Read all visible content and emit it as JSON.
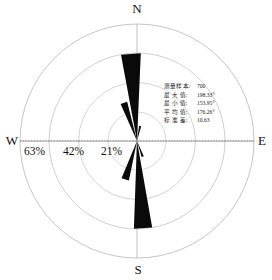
{
  "compass": {
    "north": "N",
    "south": "S",
    "west": "W",
    "east": "E"
  },
  "ring_labels": [
    "63%",
    "42%",
    "21%"
  ],
  "stats": [
    {
      "key": "测量样本:",
      "value": "700"
    },
    {
      "key": "最 大 值:",
      "value": "198.33°"
    },
    {
      "key": "最 小 值:",
      "value": "153.95°"
    },
    {
      "key": "平 均 值:",
      "value": "176.26°"
    },
    {
      "key": "标 准 差:",
      "value": "10.63"
    }
  ],
  "colors": {
    "petal_fill": "#0a0a0a",
    "grid_line": "#b9b9b9",
    "axis_line": "#9a9a9a",
    "text": "#111111"
  },
  "chart_data": {
    "type": "bar",
    "subtype": "wind-rose",
    "title": "",
    "xlabel": "",
    "ylabel": "",
    "orientation": "compass",
    "grid": true,
    "legend_position": "none",
    "radial_axis": {
      "unit": "%",
      "tick_values": [
        21,
        42,
        63
      ],
      "tick_labels": [
        "21%",
        "42%",
        "63%"
      ],
      "rlim": [
        0,
        84
      ]
    },
    "angular_axis": {
      "unit": "degrees",
      "zero_at": "N",
      "direction": "clockwise",
      "cardinal_labels": [
        "N",
        "E",
        "S",
        "W"
      ]
    },
    "categories": [
      176,
      198,
      153,
      356,
      18,
      338
    ],
    "values": [
      63,
      30,
      12,
      63,
      28,
      11
    ],
    "series": [
      {
        "name": "方位频率",
        "petals": [
          {
            "center_deg": 176,
            "half_width_deg": 6.0,
            "value": 63
          },
          {
            "center_deg": 197,
            "half_width_deg": 5.5,
            "value": 29
          },
          {
            "center_deg": 160,
            "half_width_deg": 4.0,
            "value": 12
          },
          {
            "center_deg": 356,
            "half_width_deg": 6.5,
            "value": 63
          },
          {
            "center_deg": 341,
            "half_width_deg": 5.0,
            "value": 29
          },
          {
            "center_deg": 12,
            "half_width_deg": 4.0,
            "value": 11
          }
        ]
      }
    ],
    "annotations": [
      "测量样本: 700",
      "最 大 值: 198.33°",
      "最 小 值: 153.95°",
      "平 均 值: 176.26°",
      "标 准 差: 10.63"
    ]
  }
}
